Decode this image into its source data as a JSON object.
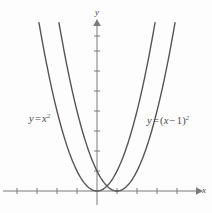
{
  "figure": {
    "background_color": "#fdfdfd",
    "curve_color": "#555555",
    "axis_color": "#7a7a7a",
    "label_color": "#4a4a4a"
  },
  "axes": {
    "x_axis_name": "x",
    "y_axis_name": "y",
    "x_axis_pixel_y": 191,
    "y_axis_pixel_x": 97,
    "unit_pixels": 20,
    "x_tick_count": 10,
    "y_tick_count": 8
  },
  "labels": {
    "left": {
      "id": "y-equals-x-squared",
      "text": "y = x²",
      "lhs": "y",
      "op": "=",
      "base": "x",
      "exponent": "2"
    },
    "right": {
      "id": "y-equals-x-minus-1-squared",
      "text": "y = (x − 1)²",
      "lhs": "y",
      "op": "=",
      "open_paren": "(",
      "base": "x",
      "minus": "−",
      "shift": "1",
      "close_paren": ")",
      "exponent": "2"
    }
  },
  "chart_data": {
    "type": "line",
    "title": "",
    "xlabel": "x",
    "ylabel": "y",
    "grid": false,
    "legend": "inline-annotations",
    "xlim": [
      -4.7,
      5.0
    ],
    "ylim": [
      -0.5,
      8.6
    ],
    "unit_pixels": 20,
    "origin_px": [
      97,
      191
    ],
    "series": [
      {
        "name": "y = x²",
        "equation": "y = x^2",
        "vertex": [
          0,
          0
        ],
        "annotation": "y = x²",
        "annotation_xy": [
          -3.3,
          3.6
        ],
        "x": [
          -2.9,
          -2.6,
          -2.3,
          -2.0,
          -1.7,
          -1.4,
          -1.1,
          -0.8,
          -0.5,
          -0.2,
          0.0,
          0.2,
          0.5,
          0.8,
          1.1,
          1.4,
          1.7,
          2.0,
          2.3,
          2.6,
          2.9
        ],
        "y": [
          8.41,
          6.76,
          5.29,
          4.0,
          2.89,
          1.96,
          1.21,
          0.64,
          0.25,
          0.04,
          0.0,
          0.04,
          0.25,
          0.64,
          1.21,
          1.96,
          2.89,
          4.0,
          5.29,
          6.76,
          8.41
        ]
      },
      {
        "name": "y = (x − 1)²",
        "equation": "y = (x - 1)^2",
        "vertex": [
          1,
          0
        ],
        "annotation": "y = (x − 1)²",
        "annotation_xy": [
          2.6,
          3.5
        ],
        "x": [
          -1.9,
          -1.6,
          -1.3,
          -1.0,
          -0.7,
          -0.4,
          -0.1,
          0.2,
          0.5,
          0.8,
          1.0,
          1.2,
          1.5,
          1.8,
          2.1,
          2.4,
          2.7,
          3.0,
          3.3,
          3.6,
          3.9
        ],
        "y": [
          8.41,
          6.76,
          5.29,
          4.0,
          2.89,
          1.96,
          1.21,
          0.64,
          0.25,
          0.04,
          0.0,
          0.04,
          0.25,
          0.64,
          1.21,
          1.96,
          2.89,
          4.0,
          5.29,
          6.76,
          8.41
        ]
      }
    ],
    "x_ticks": [
      -4,
      -3,
      -2,
      -1,
      0,
      1,
      2,
      3,
      4
    ],
    "y_ticks": [
      1,
      2,
      3,
      4,
      5,
      6,
      7,
      8
    ],
    "tick_labels_shown": false
  }
}
